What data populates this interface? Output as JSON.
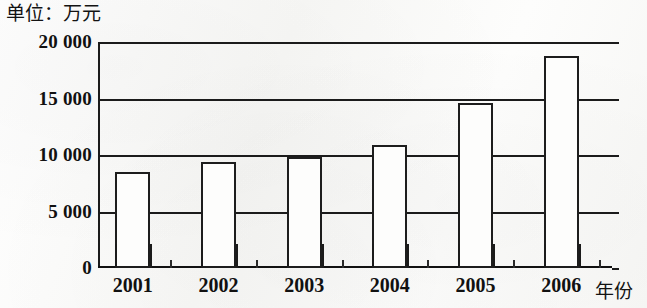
{
  "chart_data": {
    "type": "bar",
    "title": "单位：万元",
    "xlabel": "年份",
    "ylabel": "",
    "categories": [
      "2001",
      "2002",
      "2003",
      "2004",
      "2005",
      "2006"
    ],
    "values": [
      8500,
      9400,
      9800,
      10900,
      14600,
      18800
    ],
    "ylim": [
      0,
      20000
    ],
    "yticks": [
      0,
      5000,
      10000,
      15000,
      20000
    ],
    "ytick_labels": [
      "0",
      "5 000",
      "10 000",
      "15 000",
      "20 000"
    ],
    "grid": true,
    "legend": null,
    "series": [
      {
        "name": "",
        "values": [
          8500,
          9400,
          9800,
          10900,
          14600,
          18800
        ]
      }
    ],
    "bar_style": {
      "fill": "#fdfdfc",
      "outline": "#1d1d1d"
    }
  },
  "figure": {
    "unit_caption": "单位：万元",
    "x_axis_title": "年份"
  }
}
